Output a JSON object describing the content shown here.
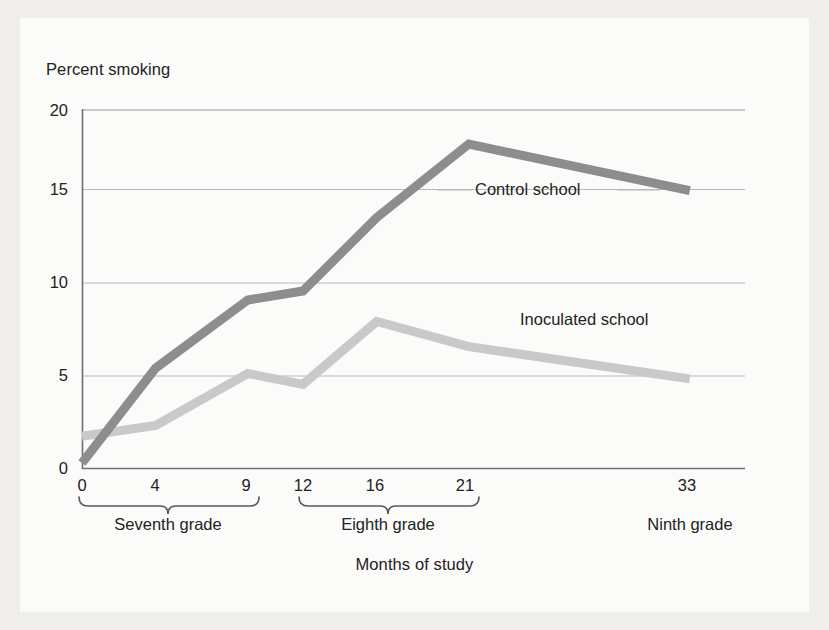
{
  "figure": {
    "background_color": "#fbfbfa",
    "page_color": "#efeeec"
  },
  "chart_data": {
    "type": "line",
    "title": "",
    "ylabel": "Percent smoking",
    "xlabel": "Months of study",
    "x": [
      0,
      4,
      9,
      12,
      16,
      21,
      33
    ],
    "xticklabels": [
      "0",
      "4",
      "9",
      "12",
      "16",
      "21",
      "33"
    ],
    "yticklabels": [
      "0",
      "5",
      "10",
      "15",
      "20"
    ],
    "yticks": [
      0,
      5,
      10,
      15,
      20
    ],
    "ylim": [
      0,
      20
    ],
    "xlim": [
      0,
      36
    ],
    "grid": "horizontal",
    "legend_position": "inline-annotations",
    "series": [
      {
        "name": "Control school",
        "color": "#8d8d8d",
        "values": [
          0.3,
          5.6,
          9.4,
          9.9,
          14.0,
          18.1,
          15.5
        ],
        "label_text": "Control school"
      },
      {
        "name": "Inoculated school",
        "color": "#c9c9c9",
        "values": [
          1.8,
          2.4,
          5.3,
          4.7,
          8.2,
          6.8,
          5.0
        ],
        "label_text": "Inoculated school"
      }
    ],
    "annotations": [
      {
        "text": "Control school"
      },
      {
        "text": "Inoculated school"
      }
    ],
    "group_brackets": [
      {
        "label": "Seventh grade",
        "ticks": [
          "0",
          "4",
          "9"
        ]
      },
      {
        "label": "Eighth grade",
        "ticks": [
          "12",
          "16",
          "21"
        ]
      },
      {
        "label": "Ninth grade",
        "ticks": [
          "33"
        ]
      }
    ]
  },
  "ticks": {
    "y": {
      "t0": "0",
      "t1": "5",
      "t2": "10",
      "t3": "15",
      "t4": "20"
    },
    "x": {
      "t0": "0",
      "t1": "4",
      "t2": "9",
      "t3": "12",
      "t4": "16",
      "t5": "21",
      "t6": "33"
    }
  },
  "labels": {
    "y_axis_title": "Percent smoking",
    "x_axis_title": "Months of study",
    "seventh_grade": "Seventh grade",
    "eighth_grade": "Eighth grade",
    "ninth_grade": "Ninth grade",
    "control_school": "Control school",
    "inoculated_school": "Inoculated school"
  }
}
